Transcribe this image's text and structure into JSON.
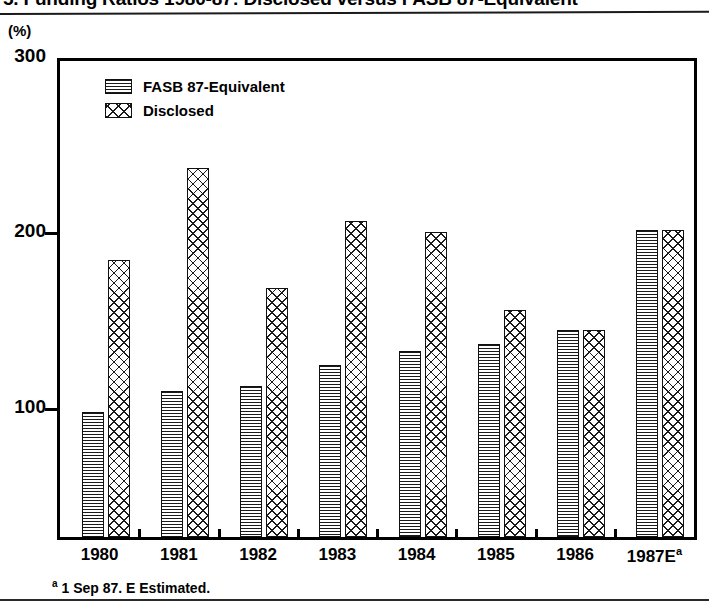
{
  "title": "5. Funding Ratios 1980-87: Disclosed versus FASB 87-Equivalent",
  "unit_label": "(%)",
  "legend": {
    "items": [
      {
        "label": "FASB  87-Equivalent",
        "pattern": "horizontal-lines"
      },
      {
        "label": "Disclosed",
        "pattern": "crosshatch"
      }
    ]
  },
  "footnote": {
    "marker": "a",
    "text": "1 Sep 87. E Estimated."
  },
  "y_axis": {
    "ticks": [
      "300",
      "200",
      "100"
    ]
  },
  "x_axis": {
    "labels": [
      "1980",
      "1981",
      "1982",
      "1983",
      "1984",
      "1985",
      "1986",
      "1987E"
    ],
    "last_label_superscript": "a"
  },
  "chart_data": {
    "type": "bar",
    "title": "5. Funding Ratios 1980-87: Disclosed versus FASB 87-Equivalent",
    "xlabel": "",
    "ylabel": "(%)",
    "ylim": [
      25,
      300
    ],
    "yticks": [
      100,
      200,
      300
    ],
    "grid": false,
    "legend_position": "top-left",
    "categories": [
      "1980",
      "1981",
      "1982",
      "1983",
      "1984",
      "1985",
      "1986",
      "1987E"
    ],
    "series": [
      {
        "name": "FASB  87-Equivalent",
        "values": [
          98,
          110,
          113,
          125,
          133,
          137,
          145,
          202
        ]
      },
      {
        "name": "Disclosed",
        "values": [
          185,
          237,
          169,
          207,
          201,
          156,
          145,
          202
        ]
      }
    ],
    "annotations": [
      "a 1 Sep 87. E Estimated."
    ]
  }
}
